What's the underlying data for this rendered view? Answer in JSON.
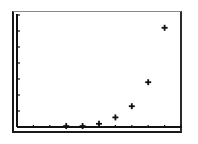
{
  "chart_data": {
    "type": "scatter",
    "title": "",
    "xlabel": "",
    "ylabel": "",
    "marker": "plus",
    "grid": false,
    "legend": null,
    "xlim": [
      0,
      10
    ],
    "ylim": [
      0,
      7
    ],
    "x_ticks": [
      1,
      2,
      3,
      4,
      5,
      6,
      7,
      8,
      9,
      10
    ],
    "y_ticks": [
      1,
      2,
      3,
      4,
      5,
      6,
      7
    ],
    "tick_labels_shown": false,
    "series": [
      {
        "name": "data",
        "x": [
          3,
          4,
          5,
          6,
          7,
          8,
          9
        ],
        "y": [
          0.06,
          0.06,
          0.2,
          0.6,
          1.3,
          2.8,
          6.2
        ]
      }
    ]
  },
  "colors": {
    "background": "#ffffff",
    "axis": "#111111",
    "marker": "#111111",
    "frame": "#1a1a1a"
  }
}
